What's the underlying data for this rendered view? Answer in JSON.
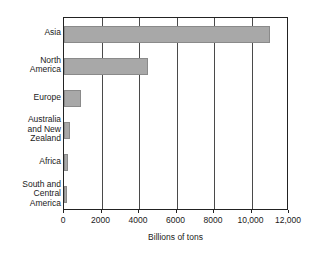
{
  "chart_data": {
    "type": "bar",
    "orientation": "horizontal",
    "title": "",
    "xlabel": "Billions of tons",
    "ylabel": "",
    "categories": [
      "Asia",
      "North\nAmerica",
      "Europe",
      "Australia\nand New\nZealand",
      "Africa",
      "South and\nCentral\nAmerica"
    ],
    "values": [
      11000,
      4500,
      880,
      300,
      200,
      150
    ],
    "xlim": [
      0,
      12000
    ],
    "xticks": [
      0,
      2000,
      4000,
      6000,
      8000,
      10000,
      12000
    ],
    "xtick_labels": [
      "0",
      "2000",
      "4000",
      "6000",
      "8000",
      "10,000",
      "12,000"
    ],
    "grid": true,
    "grid_axis": "x",
    "legend": false,
    "bar_color": "#a8a8a8",
    "frame_color": "#222222"
  }
}
